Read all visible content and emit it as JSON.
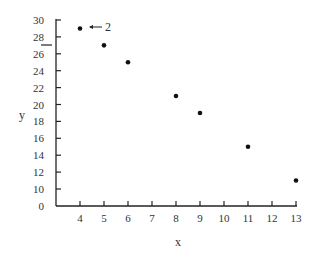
{
  "chart_data": {
    "type": "scatter",
    "title": "",
    "xlabel": "x",
    "ylabel": "y",
    "x": [
      4,
      5,
      6,
      8,
      9,
      11,
      13
    ],
    "y": [
      29,
      27,
      25,
      21,
      19,
      15,
      11
    ],
    "series": [
      {
        "name": "data",
        "x": [
          4,
          5,
          6,
          8,
          9,
          11,
          13
        ],
        "values": [
          29,
          27,
          25,
          21,
          19,
          15,
          11
        ]
      }
    ],
    "x_ticks": [
      "4",
      "5",
      "6",
      "7",
      "8",
      "9",
      "10",
      "11",
      "12",
      "13"
    ],
    "y_ticks": [
      "0",
      "10",
      "12",
      "14",
      "16",
      "18",
      "20",
      "22",
      "24",
      "26",
      "28",
      "30"
    ],
    "xlim": [
      3,
      13
    ],
    "ylim": [
      0,
      30
    ],
    "y_axis_break": "between 0 and 10",
    "grid": false,
    "legend": null,
    "annotations": [
      {
        "text": "2",
        "arrow": "left",
        "points_to": {
          "x": 4,
          "y": 29
        }
      },
      {
        "text": "",
        "type": "horizontal-marker",
        "at_y": 27,
        "position": "left of y-axis"
      }
    ]
  },
  "labels": {
    "x_axis": "x",
    "y_axis": "y",
    "annotation": "2"
  }
}
